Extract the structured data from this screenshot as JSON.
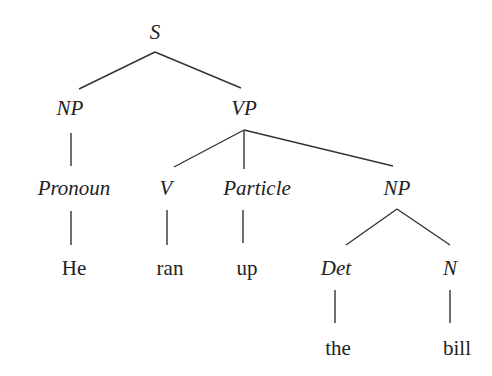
{
  "diagram": {
    "type": "syntax-tree",
    "line_color": "#333333",
    "nodes": {
      "s": {
        "label": "S",
        "x": 155,
        "y": 32
      },
      "np1": {
        "label": "NP",
        "x": 70,
        "y": 108
      },
      "vp": {
        "label": "VP",
        "x": 244,
        "y": 108
      },
      "pronoun": {
        "label": "Pronoun",
        "x": 74,
        "y": 188
      },
      "v": {
        "label": "V",
        "x": 166,
        "y": 188
      },
      "particle": {
        "label": "Particle",
        "x": 257,
        "y": 188
      },
      "np2": {
        "label": "NP",
        "x": 397,
        "y": 188
      },
      "he": {
        "label": "He",
        "x": 74,
        "y": 268
      },
      "ran": {
        "label": "ran",
        "x": 170,
        "y": 268
      },
      "up": {
        "label": "up",
        "x": 247,
        "y": 268
      },
      "det": {
        "label": "Det",
        "x": 336,
        "y": 268
      },
      "n": {
        "label": "N",
        "x": 450,
        "y": 268
      },
      "the": {
        "label": "the",
        "x": 338,
        "y": 348
      },
      "bill": {
        "label": "bill",
        "x": 457,
        "y": 348
      }
    },
    "edges": [
      {
        "from": "S",
        "to": "NP",
        "x1": 155,
        "y1": 52,
        "x2": 79,
        "y2": 89
      },
      {
        "from": "S",
        "to": "VP",
        "x1": 155,
        "y1": 52,
        "x2": 241,
        "y2": 88
      },
      {
        "from": "NP",
        "to": "Pronoun",
        "x1": 71,
        "y1": 133,
        "x2": 71,
        "y2": 166
      },
      {
        "from": "VP",
        "to": "V",
        "x1": 244,
        "y1": 130,
        "x2": 174,
        "y2": 167
      },
      {
        "from": "VP",
        "to": "Particle",
        "x1": 244,
        "y1": 130,
        "x2": 244,
        "y2": 169
      },
      {
        "from": "VP",
        "to": "NP",
        "x1": 244,
        "y1": 130,
        "x2": 393,
        "y2": 166
      },
      {
        "from": "Pronoun",
        "to": "He",
        "x1": 71,
        "y1": 211,
        "x2": 71,
        "y2": 245
      },
      {
        "from": "V",
        "to": "ran",
        "x1": 167,
        "y1": 210,
        "x2": 167,
        "y2": 245
      },
      {
        "from": "Particle",
        "to": "up",
        "x1": 243,
        "y1": 210,
        "x2": 243,
        "y2": 243
      },
      {
        "from": "NP",
        "to": "Det",
        "x1": 397,
        "y1": 209,
        "x2": 346,
        "y2": 245
      },
      {
        "from": "NP",
        "to": "N",
        "x1": 397,
        "y1": 209,
        "x2": 450,
        "y2": 245
      },
      {
        "from": "Det",
        "to": "the",
        "x1": 335,
        "y1": 290,
        "x2": 335,
        "y2": 323
      },
      {
        "from": "N",
        "to": "bill",
        "x1": 450,
        "y1": 290,
        "x2": 450,
        "y2": 323
      }
    ]
  }
}
